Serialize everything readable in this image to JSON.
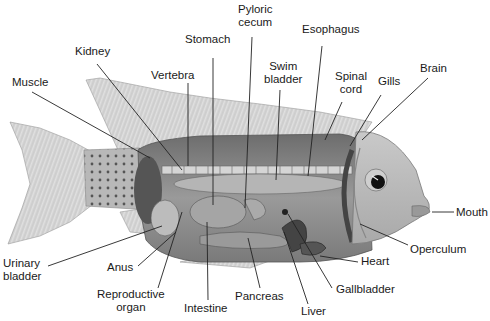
{
  "figure": {
    "colors": {
      "background": "#ffffff",
      "label_text": "#1a1a1a",
      "leader_line": "#222222",
      "body_gray": "#8a8a8a",
      "fin_gray": "#d8d8d8"
    }
  },
  "labels": {
    "pyloric_cecum": [
      "Pyloric",
      "cecum"
    ],
    "esophagus": "Esophagus",
    "stomach": "Stomach",
    "kidney": "Kidney",
    "vertebra": "Vertebra",
    "swim_bladder": [
      "Swim",
      "bladder"
    ],
    "spinal_cord": [
      "Spinal",
      "cord"
    ],
    "gills": "Gills",
    "brain": "Brain",
    "muscle": "Muscle",
    "mouth": "Mouth",
    "operculum": "Operculum",
    "heart": "Heart",
    "gallbladder": "Gallbladder",
    "liver": "Liver",
    "pancreas": "Pancreas",
    "intestine": "Intestine",
    "reproductive_organ": [
      "Reproductive",
      "organ"
    ],
    "anus": "Anus",
    "urinary_bladder": [
      "Urinary",
      "bladder"
    ]
  }
}
